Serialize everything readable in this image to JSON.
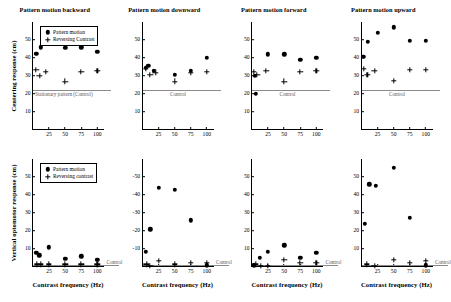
{
  "figure": {
    "rows": [
      {
        "id": "centering",
        "ylabel": "Centering response (cm)",
        "yticks": [
          "10",
          "20",
          "30",
          "40",
          "50"
        ],
        "ylim": [
          0,
          60
        ],
        "ytick_values": [
          10,
          20,
          30,
          40,
          50
        ],
        "control_value": 22,
        "legend": {
          "pattern_label": "Pattern motion",
          "reversing_label": "Reversing Contrast"
        }
      },
      {
        "id": "optomotor",
        "ylabel": "Vertical optomotor response (cm)",
        "xlabel": "Contrast frequency (Hz)",
        "legend": {
          "pattern_label": "Pattern motion",
          "reversing_label": "Reversing contrast"
        }
      }
    ],
    "xticks": [
      "25",
      "50",
      "75",
      "100"
    ],
    "xtick_values": [
      25,
      50,
      75,
      100
    ],
    "xlim": [
      0,
      112
    ],
    "xlabel": "Contrast frequency (Hz)",
    "control_label_short": "Control",
    "control_label_long": "Stationary pattern (Control)",
    "colors": {
      "axis": "#000000",
      "marker": "#000000",
      "control_line": "#8a8a8a",
      "control_text": "#555555"
    }
  },
  "chart_data": [
    {
      "type": "scatter",
      "panel": "top-1",
      "title": "Pattern motion backward",
      "xlabel": "",
      "ylabel": "Centering response (cm)",
      "xlim": [
        0,
        112
      ],
      "ylim": [
        0,
        60
      ],
      "grid": false,
      "control_line": 22,
      "control_annotation": "Stationary pattern (Control)",
      "series": [
        {
          "name": "Pattern motion",
          "marker": "dot",
          "x": [
            5,
            12,
            22,
            50,
            75,
            100
          ],
          "y": [
            42.5,
            46,
            48,
            45.5,
            46,
            43.5
          ]
        },
        {
          "name": "Reversing Contrast",
          "marker": "plus",
          "x": [
            5,
            10,
            20,
            50,
            75,
            100
          ],
          "y": [
            33.5,
            30,
            32.5,
            27,
            32.5,
            33
          ]
        }
      ]
    },
    {
      "type": "scatter",
      "panel": "top-2",
      "title": "Pattern motion downward",
      "xlabel": "",
      "ylabel": "",
      "xlim": [
        0,
        112
      ],
      "ylim": [
        0,
        60
      ],
      "grid": false,
      "control_line": 22,
      "control_annotation": "Control",
      "series": [
        {
          "name": "Pattern motion",
          "marker": "dot",
          "x": [
            5,
            9,
            18,
            50,
            75,
            100
          ],
          "y": [
            34.5,
            35.5,
            33,
            30.5,
            33,
            40
          ]
        },
        {
          "name": "Reversing Contrast",
          "marker": "plus",
          "x": [
            5,
            12,
            20,
            50,
            75,
            100
          ],
          "y": [
            34,
            30.5,
            32,
            27,
            32,
            32.5
          ]
        }
      ]
    },
    {
      "type": "scatter",
      "panel": "top-3",
      "title": "Pattern motion forward",
      "xlabel": "",
      "ylabel": "",
      "xlim": [
        0,
        112
      ],
      "ylim": [
        0,
        60
      ],
      "grid": false,
      "control_line": 22,
      "control_annotation": "Control",
      "series": [
        {
          "name": "Pattern motion",
          "marker": "dot",
          "x": [
            4,
            6,
            25,
            50,
            75,
            100
          ],
          "y": [
            30,
            20,
            42,
            42,
            39,
            40
          ]
        },
        {
          "name": "Reversing Contrast",
          "marker": "plus",
          "x": [
            3,
            8,
            22,
            50,
            75,
            100
          ],
          "y": [
            32.5,
            30.5,
            33,
            27,
            32.5,
            33
          ]
        }
      ]
    },
    {
      "type": "scatter",
      "panel": "top-4",
      "title": "Pattern motion upward",
      "xlabel": "",
      "ylabel": "",
      "xlim": [
        0,
        112
      ],
      "ylim": [
        0,
        60
      ],
      "grid": false,
      "control_line": 22,
      "control_annotation": "Control",
      "series": [
        {
          "name": "Pattern motion",
          "marker": "dot",
          "x": [
            3,
            10,
            25,
            50,
            75,
            100
          ],
          "y": [
            40.5,
            49,
            54,
            57,
            49.5,
            49.5
          ]
        },
        {
          "name": "Reversing Contrast",
          "marker": "plus",
          "x": [
            4,
            9,
            20,
            50,
            75,
            100
          ],
          "y": [
            34,
            30.5,
            33,
            27.5,
            33.5,
            33.5
          ]
        }
      ]
    },
    {
      "type": "scatter",
      "panel": "bottom-1",
      "title": "",
      "xlabel": "Contrast frequency (Hz)",
      "ylabel": "Vertical optomotor response (cm)",
      "xlim": [
        0,
        112
      ],
      "ylim": [
        0,
        60
      ],
      "grid": false,
      "control_line": 1,
      "control_annotation": "Control",
      "series": [
        {
          "name": "Pattern motion",
          "marker": "dot",
          "x": [
            5,
            10,
            25,
            50,
            75,
            100
          ],
          "y": [
            8,
            6.5,
            11,
            4.5,
            6,
            4
          ]
        },
        {
          "name": "Reversing contrast",
          "marker": "plus",
          "x": [
            6,
            12,
            25,
            50,
            75,
            100
          ],
          "y": [
            1.5,
            1.5,
            1.5,
            1.5,
            1.5,
            1.5
          ]
        }
      ]
    },
    {
      "type": "scatter",
      "panel": "bottom-2",
      "title": "",
      "xlabel": "Contrast frequency (Hz)",
      "ylabel": "",
      "yticks": [
        "-10",
        "-20",
        "-30",
        "-40",
        "-50"
      ],
      "xlim": [
        0,
        112
      ],
      "ylim": [
        0,
        -60
      ],
      "grid": false,
      "control_line": -1,
      "control_annotation": "Control",
      "series": [
        {
          "name": "Pattern motion",
          "marker": "dot",
          "x": [
            5,
            12,
            25,
            50,
            75,
            100
          ],
          "y": [
            -8.5,
            -21,
            -44,
            -43,
            -26,
            -1
          ]
        },
        {
          "name": "Reversing contrast",
          "marker": "plus",
          "x": [
            6,
            12,
            25,
            50,
            75,
            100
          ],
          "y": [
            -1.5,
            -0.5,
            -3.5,
            -1.5,
            -2.5,
            -2.5
          ]
        }
      ]
    },
    {
      "type": "scatter",
      "panel": "bottom-3",
      "title": "",
      "xlabel": "Contrast frequency (Hz)",
      "ylabel": "",
      "xlim": [
        0,
        112
      ],
      "ylim": [
        0,
        60
      ],
      "grid": false,
      "control_line": 1,
      "control_annotation": "Control",
      "series": [
        {
          "name": "Pattern motion",
          "marker": "dot",
          "x": [
            3,
            12,
            25,
            50,
            75,
            100
          ],
          "y": [
            1,
            5,
            8.5,
            12,
            5,
            8
          ]
        },
        {
          "name": "Reversing contrast",
          "marker": "plus",
          "x": [
            6,
            14,
            25,
            50,
            75,
            100
          ],
          "y": [
            1.5,
            0.5,
            0.5,
            4,
            2.5,
            2.5
          ]
        }
      ]
    },
    {
      "type": "scatter",
      "panel": "bottom-4",
      "title": "",
      "xlabel": "Contrast frequency (Hz)",
      "ylabel": "",
      "xlim": [
        0,
        112
      ],
      "ylim": [
        0,
        60
      ],
      "grid": false,
      "control_line": 1,
      "control_annotation": "Control",
      "series": [
        {
          "name": "Pattern motion",
          "marker": "dot",
          "x": [
            5,
            12,
            22,
            50,
            75,
            100
          ],
          "y": [
            24,
            46,
            45,
            55,
            27.5,
            1
          ]
        },
        {
          "name": "Reversing contrast",
          "marker": "plus",
          "x": [
            8,
            20,
            50,
            75,
            100
          ],
          "y": [
            1.5,
            0.5,
            4,
            2.5,
            3.5
          ]
        }
      ]
    }
  ]
}
